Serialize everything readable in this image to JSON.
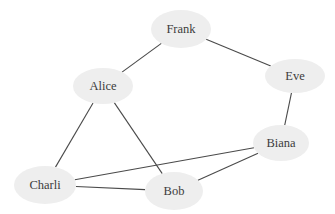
{
  "graph": {
    "type": "undirected",
    "colors": {
      "node_fill": "#eeeeee",
      "edge": "#4a4a4a",
      "label": "#3c3c3c",
      "background": "#ffffff"
    },
    "nodes": [
      {
        "id": "Frank",
        "label": "Frank"
      },
      {
        "id": "Alice",
        "label": "Alice"
      },
      {
        "id": "Eve",
        "label": "Eve"
      },
      {
        "id": "Biana",
        "label": "Biana"
      },
      {
        "id": "Charli",
        "label": "Charli"
      },
      {
        "id": "Bob",
        "label": "Bob"
      }
    ],
    "edges": [
      {
        "source": "Frank",
        "target": "Alice"
      },
      {
        "source": "Frank",
        "target": "Eve"
      },
      {
        "source": "Eve",
        "target": "Biana"
      },
      {
        "source": "Alice",
        "target": "Charli"
      },
      {
        "source": "Alice",
        "target": "Bob"
      },
      {
        "source": "Biana",
        "target": "Charli"
      },
      {
        "source": "Biana",
        "target": "Bob"
      },
      {
        "source": "Charli",
        "target": "Bob"
      }
    ]
  }
}
